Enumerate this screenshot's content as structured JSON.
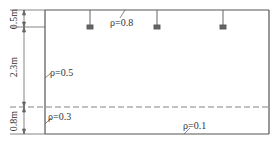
{
  "diagram": {
    "dimensions": [
      {
        "label": "0.5m",
        "meaning": "ceiling cavity height"
      },
      {
        "label": "2.3m",
        "meaning": "room cavity height"
      },
      {
        "label": "0.8m",
        "meaning": "floor cavity height (work plane)"
      }
    ],
    "reflectances": {
      "ceiling": "ρ=0.8",
      "wall": "ρ=0.5",
      "lower_wall": "ρ=0.3",
      "floor": "ρ=0.1"
    },
    "luminaires": {
      "count": 3,
      "icon": "pendant-lamp-icon"
    },
    "work_plane": {
      "style": "dashed"
    },
    "colors": {
      "line": "#555555",
      "text": "#333333",
      "background": "#ffffff"
    }
  }
}
